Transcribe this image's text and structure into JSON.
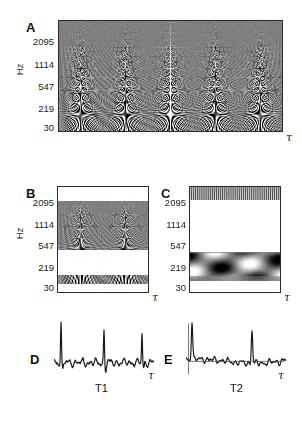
{
  "figure": {
    "axis_unit_label": "Hz",
    "time_axis_symbol": "τ"
  },
  "panels": {
    "A": {
      "letter": "A",
      "yticks": [
        "2095",
        "1114",
        "547",
        "219",
        "30"
      ],
      "ylabel": "Hz",
      "xlabel": "τ"
    },
    "B": {
      "letter": "B",
      "yticks": [
        "2095",
        "1114",
        "547",
        "219",
        "30"
      ],
      "ylabel": "Hz",
      "xlabel": "τ"
    },
    "C": {
      "letter": "C",
      "yticks": [
        "2095",
        "1114",
        "547",
        "219",
        "30"
      ],
      "xlabel": "τ"
    },
    "D": {
      "letter": "D",
      "signal_label": "T1",
      "xlabel": "τ"
    },
    "E": {
      "letter": "E",
      "signal_label": "T2",
      "xlabel": "τ"
    }
  },
  "chart_data": [
    {
      "id": "panel-A",
      "type": "heatmap",
      "title": "A",
      "ylabel": "Hz",
      "xlabel": "τ",
      "ytick_labels": [
        "2095",
        "1114",
        "547",
        "219",
        "30"
      ],
      "ytick_positions_frac": [
        0.12,
        0.33,
        0.52,
        0.72,
        0.95
      ],
      "grid": false,
      "legend": "none",
      "colormap": "grayscale",
      "description": "Full-band wavelet scalogram of an ECG signal; five repeating chirp ridge structures across time, energy concentrated at low frequencies",
      "repetitions": 5,
      "frequency_bands": [
        {
          "name": "high",
          "top_frac": 0.0,
          "bottom_frac": 0.3,
          "mean_gray": 0.55,
          "contrast": 0.25
        },
        {
          "name": "mid",
          "top_frac": 0.3,
          "bottom_frac": 0.62,
          "mean_gray": 0.5,
          "contrast": 0.85
        },
        {
          "name": "low",
          "top_frac": 0.62,
          "bottom_frac": 1.0,
          "mean_gray": 0.5,
          "contrast": 1.0
        }
      ]
    },
    {
      "id": "panel-B",
      "type": "heatmap",
      "title": "B",
      "ylabel": "Hz",
      "xlabel": "τ",
      "ytick_labels": [
        "2095",
        "1114",
        "547",
        "219",
        "30"
      ],
      "ytick_positions_frac": [
        0.12,
        0.33,
        0.52,
        0.72,
        0.95
      ],
      "grid": false,
      "legend": "none",
      "colormap": "grayscale",
      "description": "Band-selected scalogram: blank above 2095 Hz, textured chirp band between 2095 and ~420 Hz, blank gap, single dark horizontal band near 30-60 Hz",
      "repetitions": 2,
      "active_bands_frac": [
        [
          0.13,
          0.6
        ],
        [
          0.84,
          0.93
        ]
      ]
    },
    {
      "id": "panel-C",
      "type": "heatmap",
      "title": "C",
      "xlabel": "τ",
      "ytick_labels": [
        "2095",
        "1114",
        "547",
        "219",
        "30"
      ],
      "ytick_positions_frac": [
        0.12,
        0.33,
        0.52,
        0.72,
        0.95
      ],
      "grid": false,
      "legend": "none",
      "colormap": "grayscale",
      "description": "Band-selected scalogram: dense fine vertical striping above 2095 Hz, large blank mid-band, wavy dark lattice between ~300 and 90 Hz, light band at bottom",
      "active_bands_frac": [
        [
          0.0,
          0.12
        ],
        [
          0.62,
          0.9
        ]
      ]
    },
    {
      "id": "panel-D",
      "type": "line",
      "title": "D",
      "xlabel": "τ",
      "annotation": "T1",
      "description": "Time-domain ECG trace with sharp periodic R-wave spikes over low-amplitude noisy baseline",
      "spike_count": 3,
      "spike_positions_frac": [
        0.07,
        0.5,
        0.88
      ],
      "spike_heights_frac": [
        1.0,
        0.78,
        0.72
      ],
      "baseline_frac": 0.72
    },
    {
      "id": "panel-E",
      "type": "line",
      "title": "E",
      "xlabel": "τ",
      "annotation": "T2",
      "description": "Time-domain trace with a tall leading spike, a long low noisy plateau, and a second prominent spike near the right",
      "spike_count": 2,
      "spike_positions_frac": [
        0.06,
        0.66
      ],
      "spike_heights_frac": [
        1.0,
        0.85
      ],
      "baseline_frac": 0.7
    }
  ]
}
